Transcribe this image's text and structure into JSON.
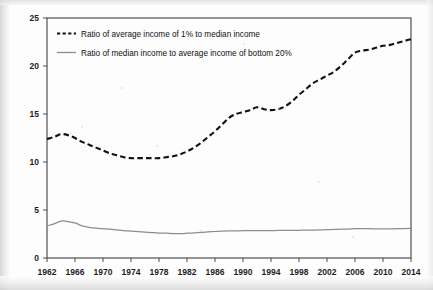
{
  "figure": {
    "background_color": "#fdfdfd",
    "frame_color": "#4a4a4a"
  },
  "legend": {
    "position": "top-left-inside",
    "entries": [
      {
        "label": "Ratio of average income of 1% to median income",
        "style": "dashed",
        "color": "#101010"
      },
      {
        "label": "Ratio of median income to average income of bottom 20%",
        "style": "solid",
        "color": "#8d8d8d"
      }
    ]
  },
  "axes": {
    "y_ticks": [
      "0",
      "5",
      "10",
      "15",
      "20",
      "25"
    ],
    "x_ticks": [
      "1962",
      "1966",
      "1970",
      "1974",
      "1978",
      "1982",
      "1986",
      "1990",
      "1994",
      "1998",
      "2002",
      "2006",
      "2010",
      "2014"
    ]
  },
  "chart_data": {
    "type": "line",
    "title": "",
    "subtitle": "",
    "xlabel": "",
    "ylabel": "",
    "xlim": [
      1962,
      2014
    ],
    "ylim": [
      0,
      25
    ],
    "grid": false,
    "legend_position": "top-left-inside",
    "x": [
      1962,
      1963,
      1964,
      1965,
      1966,
      1967,
      1968,
      1969,
      1970,
      1971,
      1972,
      1973,
      1974,
      1975,
      1976,
      1977,
      1978,
      1979,
      1980,
      1981,
      1982,
      1983,
      1984,
      1985,
      1986,
      1987,
      1988,
      1989,
      1990,
      1991,
      1992,
      1993,
      1994,
      1995,
      1996,
      1997,
      1998,
      1999,
      2000,
      2001,
      2002,
      2003,
      2004,
      2005,
      2006,
      2007,
      2008,
      2009,
      2010,
      2011,
      2012,
      2013,
      2014
    ],
    "series": [
      {
        "name": "Ratio of average income of 1% to median income",
        "style": "dashed",
        "color": "#101010",
        "values": [
          12.4,
          12.6,
          12.9,
          12.8,
          12.5,
          12.1,
          11.8,
          11.5,
          11.2,
          10.9,
          10.7,
          10.5,
          10.4,
          10.4,
          10.4,
          10.4,
          10.4,
          10.5,
          10.6,
          10.8,
          11.1,
          11.5,
          12.0,
          12.6,
          13.2,
          13.9,
          14.6,
          15.0,
          15.2,
          15.4,
          15.7,
          15.5,
          15.4,
          15.5,
          15.8,
          16.3,
          17.0,
          17.6,
          18.2,
          18.6,
          19.0,
          19.4,
          20.0,
          20.7,
          21.4,
          21.6,
          21.7,
          21.9,
          22.1,
          22.2,
          22.4,
          22.6,
          22.8
        ]
      },
      {
        "name": "Ratio of median income to average income of bottom 20%",
        "style": "solid",
        "color": "#8d8d8d",
        "values": [
          3.35,
          3.55,
          3.85,
          3.8,
          3.65,
          3.35,
          3.2,
          3.1,
          3.05,
          3.0,
          2.92,
          2.85,
          2.8,
          2.75,
          2.7,
          2.65,
          2.6,
          2.58,
          2.55,
          2.55,
          2.58,
          2.62,
          2.68,
          2.72,
          2.76,
          2.8,
          2.82,
          2.83,
          2.84,
          2.85,
          2.85,
          2.86,
          2.86,
          2.87,
          2.88,
          2.88,
          2.89,
          2.9,
          2.9,
          2.92,
          2.95,
          2.98,
          3.0,
          3.02,
          3.05,
          3.05,
          3.05,
          3.04,
          3.04,
          3.04,
          3.05,
          3.06,
          3.08
        ]
      }
    ]
  }
}
